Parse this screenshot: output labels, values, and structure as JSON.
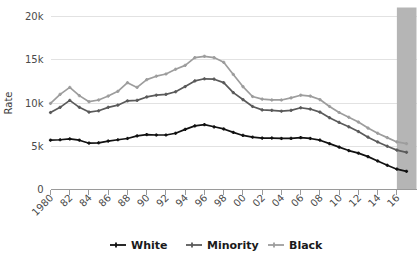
{
  "chart_data": {
    "type": "line",
    "title": "",
    "xlabel": "",
    "ylabel": "Rate",
    "ylim": [
      0,
      20000
    ],
    "xlim": [
      1980,
      2017
    ],
    "grid": true,
    "legend_position": "bottom",
    "ytick_labels": [
      "0",
      "5k",
      "10k",
      "15k",
      "20k"
    ],
    "ytick_values": [
      0,
      5000,
      10000,
      15000,
      20000
    ],
    "xtick_labels": [
      "1980",
      "82",
      "84",
      "86",
      "88",
      "90",
      "92",
      "94",
      "96",
      "98",
      "00",
      "02",
      "04",
      "06",
      "08",
      "10",
      "12",
      "14",
      "16"
    ],
    "xtick_values": [
      1980,
      1982,
      1984,
      1986,
      1988,
      1990,
      1992,
      1994,
      1996,
      1998,
      2000,
      2002,
      2004,
      2006,
      2008,
      2010,
      2012,
      2014,
      2016
    ],
    "x": [
      1980,
      1981,
      1982,
      1983,
      1984,
      1985,
      1986,
      1987,
      1988,
      1989,
      1990,
      1991,
      1992,
      1993,
      1994,
      1995,
      1996,
      1997,
      1998,
      1999,
      2000,
      2001,
      2002,
      2003,
      2004,
      2005,
      2006,
      2007,
      2008,
      2009,
      2010,
      2011,
      2012,
      2013,
      2014,
      2015,
      2016,
      2017
    ],
    "series": [
      {
        "name": "White",
        "color": "#111111",
        "marker": "plus",
        "values": [
          5700,
          5750,
          5850,
          5700,
          5350,
          5400,
          5600,
          5750,
          5900,
          6200,
          6350,
          6300,
          6300,
          6500,
          6950,
          7350,
          7500,
          7250,
          7000,
          6600,
          6250,
          6050,
          5950,
          5950,
          5900,
          5900,
          6000,
          5900,
          5700,
          5300,
          4900,
          4500,
          4200,
          3800,
          3300,
          2800,
          2350,
          2100
        ]
      },
      {
        "name": "Minority",
        "color": "#5a5a5a",
        "marker": "plus",
        "values": [
          8900,
          9500,
          10300,
          9500,
          8950,
          9100,
          9500,
          9750,
          10250,
          10300,
          10700,
          10900,
          11000,
          11300,
          11900,
          12550,
          12800,
          12750,
          12350,
          11200,
          10400,
          9600,
          9200,
          9150,
          9050,
          9150,
          9450,
          9300,
          8950,
          8300,
          7750,
          7250,
          6700,
          6050,
          5500,
          5000,
          4550,
          4300
        ]
      },
      {
        "name": "Black",
        "color": "#9d9d9d",
        "marker": "plus",
        "values": [
          9950,
          11000,
          11800,
          10850,
          10150,
          10350,
          10800,
          11350,
          12350,
          11800,
          12700,
          13100,
          13350,
          13900,
          14350,
          15250,
          15400,
          15250,
          14700,
          13300,
          11900,
          10750,
          10450,
          10350,
          10350,
          10600,
          10900,
          10800,
          10400,
          9600,
          8900,
          8350,
          7800,
          7100,
          6500,
          6000,
          5500,
          5300
        ]
      }
    ],
    "shaded_band": {
      "name": "projection-band",
      "x_start": 2016.0,
      "x_end": 2017.2,
      "color": "#b5b5b5"
    },
    "legend": [
      {
        "label": "White",
        "color": "#111111"
      },
      {
        "label": "Minority",
        "color": "#5a5a5a"
      },
      {
        "label": "Black",
        "color": "#9d9d9d"
      }
    ]
  }
}
